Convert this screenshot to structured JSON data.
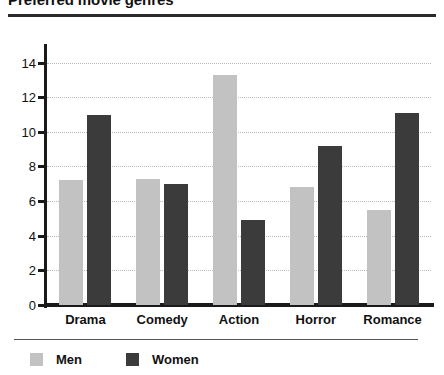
{
  "chart_data": {
    "type": "bar",
    "title": "Preferred movie genres",
    "categories": [
      "Drama",
      "Comedy",
      "Action",
      "Horror",
      "Romance"
    ],
    "series": [
      {
        "name": "Men",
        "color": "#c2c2c2",
        "values": [
          7.2,
          7.3,
          13.3,
          6.8,
          5.5
        ]
      },
      {
        "name": "Women",
        "color": "#3b3b3b",
        "values": [
          11.0,
          7.0,
          4.9,
          9.2,
          11.1
        ]
      }
    ],
    "xlabel": "",
    "ylabel": "",
    "ylim": [
      0,
      14.9
    ],
    "yticks": [
      0,
      2,
      4,
      6,
      8,
      10,
      12,
      14
    ],
    "ytick_labels": [
      "0",
      "2",
      "4",
      "6",
      "8",
      "10",
      "12",
      "14"
    ],
    "grid": true,
    "grid_style": "dotted",
    "legend_position": "bottom-left"
  }
}
